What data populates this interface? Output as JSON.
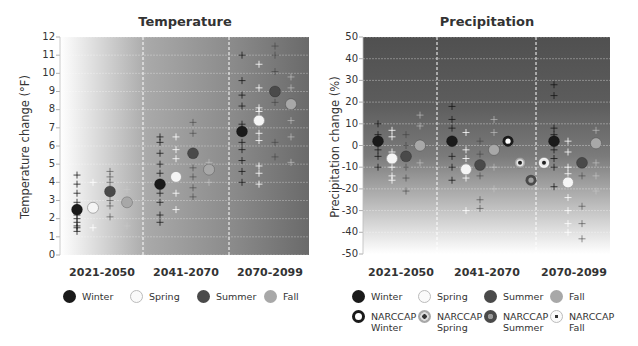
{
  "chart_data": [
    {
      "type": "scatter",
      "title": "Temperature",
      "xlabel": "",
      "ylabel": "Temperature change (°F)",
      "ylim": [
        0,
        12
      ],
      "yticks": [
        0,
        1,
        2,
        3,
        4,
        5,
        6,
        7,
        8,
        9,
        10,
        11,
        12
      ],
      "categories": [
        "2021-2050",
        "2041-2070",
        "2070-2099"
      ],
      "grid": true,
      "legend_position": "bottom",
      "series": [
        {
          "name": "Winter",
          "color": "#1a1a1a",
          "means": [
            2.5,
            3.9,
            6.8
          ],
          "models": [
            [
              4.4,
              3.9,
              3.4,
              2.9,
              2.5,
              2.2,
              2.0,
              1.8,
              1.6,
              1.5,
              1.3
            ],
            [
              6.5,
              6.2,
              5.6,
              5.0,
              4.5,
              3.9,
              3.4,
              2.9,
              2.2,
              1.8
            ],
            [
              11.0,
              9.6,
              8.8,
              8.2,
              7.2,
              6.2,
              5.8,
              5.2,
              4.6,
              4.0
            ]
          ]
        },
        {
          "name": "Spring",
          "color": "#f5f5f5",
          "means": [
            2.6,
            4.3,
            7.4
          ],
          "models": [
            [
              4.0,
              2.6,
              1.5
            ],
            [
              6.5,
              5.8,
              5.3,
              3.4,
              2.5
            ],
            [
              10.5,
              9.2,
              8.1,
              7.9,
              6.7,
              6.3,
              4.9,
              4.5,
              3.9
            ]
          ]
        },
        {
          "name": "Summer",
          "color": "#4a4a4a",
          "means": [
            3.5,
            5.6,
            9.0
          ],
          "models": [
            [
              4.6,
              4.3,
              4.0,
              3.5,
              3.0,
              2.7,
              2.1
            ],
            [
              7.3,
              6.7,
              5.6,
              4.8,
              4.3,
              3.7,
              3.2
            ],
            [
              11.5,
              11.0,
              10.1,
              9.0,
              8.4,
              6.2,
              5.4
            ]
          ]
        },
        {
          "name": "Fall",
          "color": "#a8a8a8",
          "means": [
            2.9,
            4.7,
            8.3
          ],
          "models": [
            [
              3.6,
              2.9,
              1.6
            ],
            [
              5.1,
              4.7,
              4.0
            ],
            [
              9.8,
              9.2,
              8.3,
              7.4,
              6.5,
              5.1
            ]
          ]
        }
      ]
    },
    {
      "type": "scatter",
      "title": "Precipitation",
      "xlabel": "",
      "ylabel": "Precipitation change (%)",
      "ylim": [
        -50,
        50
      ],
      "yticks": [
        50,
        40,
        30,
        20,
        10,
        0,
        -10,
        -20,
        -30,
        -40,
        -50
      ],
      "categories": [
        "2021-2050",
        "2041-2070",
        "2070-2099"
      ],
      "grid": true,
      "legend_position": "bottom",
      "series": [
        {
          "name": "Winter",
          "color": "#1a1a1a",
          "means": [
            2,
            2,
            2
          ],
          "models": [
            [
              10,
              5,
              2,
              -2,
              -5,
              -10
            ],
            [
              18,
              12,
              8,
              2,
              -5,
              -10,
              -16
            ],
            [
              28,
              23,
              8,
              5,
              2,
              -2,
              -6,
              -10,
              -19
            ]
          ]
        },
        {
          "name": "Spring",
          "color": "#f5f5f5",
          "means": [
            -6,
            -11,
            -17
          ],
          "models": [
            [
              7,
              4,
              -3,
              -6,
              -10,
              -14,
              -16
            ],
            [
              6,
              -2,
              -6,
              -11,
              -15,
              -30
            ],
            [
              2,
              -3,
              -10,
              -13,
              -17,
              -24,
              -30,
              -36,
              -40
            ]
          ]
        },
        {
          "name": "Summer",
          "color": "#4a4a4a",
          "means": [
            -5,
            -9,
            -8
          ],
          "models": [
            [
              5,
              0,
              -5,
              -10,
              -15,
              -21
            ],
            [
              2,
              -4,
              -9,
              -14,
              -25,
              -29
            ],
            [
              -8,
              -14,
              -28,
              -36,
              -43
            ]
          ]
        },
        {
          "name": "Fall",
          "color": "#a8a8a8",
          "means": [
            0,
            -2,
            1
          ],
          "models": [
            [
              14,
              9,
              0,
              -8
            ],
            [
              12,
              6,
              -2,
              -10,
              -20
            ],
            [
              7,
              1,
              -8,
              -14,
              -21
            ]
          ]
        },
        {
          "name": "NARCCAP Winter",
          "color": "#1a1a1a",
          "marker": "ring-white-center",
          "means": [
            null,
            2,
            null
          ]
        },
        {
          "name": "NARCCAP Spring",
          "color": "#a8a8a8",
          "marker": "dot-dark-center",
          "means": [
            null,
            -8,
            null
          ]
        },
        {
          "name": "NARCCAP Summer",
          "color": "#4a4a4a",
          "marker": "dot-light-center",
          "means": [
            null,
            -16,
            null
          ]
        },
        {
          "name": "NARCCAP Fall",
          "color": "#f5f5f5",
          "marker": "dot-dark-center",
          "means": [
            null,
            -8,
            null
          ]
        }
      ]
    }
  ],
  "temperature": {
    "title": "Temperature",
    "ylabel": "Temperature change (°F)",
    "yticks": [
      "12",
      "11",
      "10",
      "9",
      "8",
      "7",
      "6",
      "5",
      "4",
      "3",
      "2",
      "1",
      "0"
    ],
    "periods": [
      "2021-2050",
      "2041-2070",
      "2070-2099"
    ],
    "legend": [
      "Winter",
      "Spring",
      "Summer",
      "Fall"
    ]
  },
  "precipitation": {
    "title": "Precipitation",
    "ylabel": "Precipitation change (%)",
    "yticks": [
      "50",
      "40",
      "30",
      "20",
      "10",
      "0",
      "-10",
      "-20",
      "-30",
      "-40",
      "-50"
    ],
    "periods": [
      "2021-2050",
      "2041-2070",
      "2070-2099"
    ],
    "legend": [
      "Winter",
      "Spring",
      "Summer",
      "Fall",
      "NARCCAP\nWinter",
      "NARCCAP\nSpring",
      "NARCCAP\nSummer",
      "NARCCAP\nFall"
    ]
  },
  "colors": {
    "winter": "#1a1a1a",
    "spring": "#f5f5f5",
    "summer": "#4a4a4a",
    "fall": "#a8a8a8",
    "temp_bg_light": "#ffffff",
    "temp_bg_dark": "#6e6e6e",
    "precip_bg_dark": "#545454",
    "precip_bg_light": "#ffffff"
  }
}
